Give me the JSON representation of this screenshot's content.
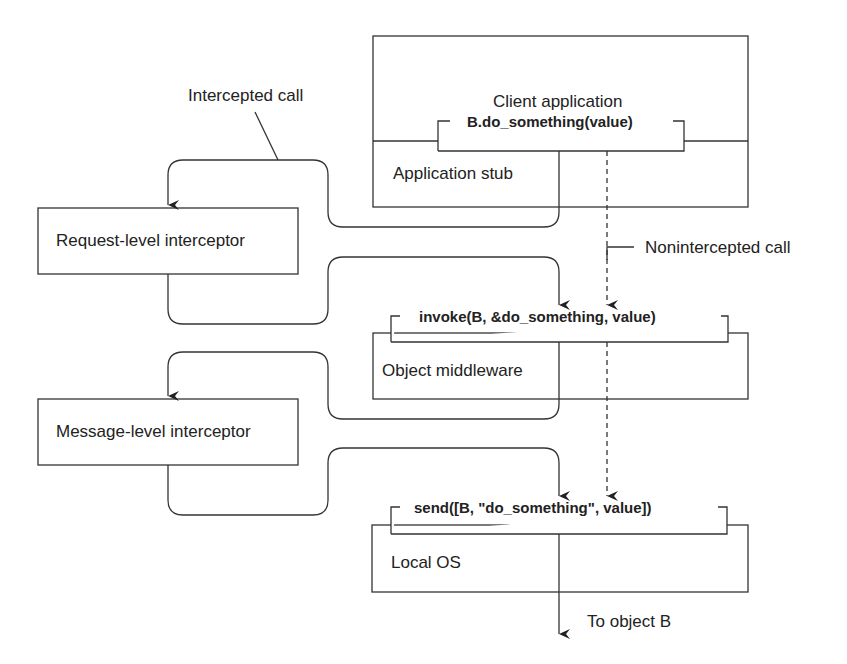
{
  "diagram": {
    "layers": {
      "client": {
        "title": "Client application",
        "call": "B.do_something(value)",
        "stub": "Application stub"
      },
      "middleware": {
        "call": "invoke(B, &do_something, value)",
        "label": "Object middleware"
      },
      "os": {
        "call": "send([B, \"do_something\", value])",
        "label": "Local OS"
      }
    },
    "interceptors": {
      "request": "Request-level interceptor",
      "message": "Message-level interceptor"
    },
    "annotations": {
      "intercepted": "Intercepted call",
      "nonintercepted": "Nonintercepted call",
      "destination": "To object B"
    },
    "colors": {
      "line": "#333333",
      "background": "#ffffff"
    }
  }
}
